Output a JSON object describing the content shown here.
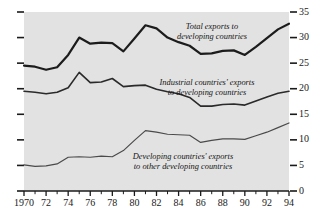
{
  "chart_data": {
    "type": "line",
    "title": "",
    "subtitle": "",
    "xlabel": "",
    "ylabel": "",
    "xlim": [
      1970,
      1994
    ],
    "ylim": [
      0,
      35
    ],
    "grid": false,
    "legend_position": "inline-annotations",
    "y_ticks": [
      "0",
      "5",
      "10",
      "15",
      "20",
      "25",
      "30",
      "35"
    ],
    "y_tick_values": [
      0,
      5,
      10,
      15,
      20,
      25,
      30,
      35
    ],
    "y_axis_side": "right",
    "x_ticks": [
      "1970",
      "72",
      "74",
      "76",
      "78",
      "80",
      "82",
      "84",
      "86",
      "88",
      "90",
      "92",
      "94"
    ],
    "x_tick_values": [
      1970,
      1972,
      1974,
      1976,
      1978,
      1980,
      1982,
      1984,
      1986,
      1988,
      1990,
      1992,
      1994
    ],
    "x_minor_tick_interval": 1,
    "x": [
      1970,
      1971,
      1972,
      1973,
      1974,
      1975,
      1976,
      1977,
      1978,
      1979,
      1980,
      1981,
      1982,
      1983,
      1984,
      1985,
      1986,
      1987,
      1988,
      1989,
      1990,
      1991,
      1992,
      1993,
      1994
    ],
    "series": [
      {
        "name": "Total exports to developing countries",
        "label_line1": "Total exports to",
        "label_line2": "developing countries",
        "color": "#1c1c1c",
        "width": 2.2,
        "values": [
          24.5,
          24.3,
          23.7,
          24.2,
          26.6,
          30.0,
          28.8,
          29.0,
          28.9,
          27.3,
          29.8,
          32.4,
          31.8,
          30.0,
          29.1,
          28.4,
          26.8,
          26.9,
          27.4,
          27.5,
          26.6,
          28.2,
          29.9,
          31.6,
          32.7
        ]
      },
      {
        "name": "Industrial countries' exports to developing countries",
        "label_line1": "Industrial countries' exports",
        "label_line2": "to developing countries",
        "color": "#2a2a2a",
        "width": 1.6,
        "values": [
          19.5,
          19.3,
          19.0,
          19.3,
          20.2,
          23.2,
          21.2,
          21.3,
          22.0,
          20.4,
          20.6,
          20.7,
          19.9,
          19.4,
          19.0,
          18.3,
          16.6,
          16.6,
          16.9,
          17.0,
          16.8,
          17.6,
          18.4,
          19.1,
          19.5
        ]
      },
      {
        "name": "Developing countries' exports to other developing countries",
        "label_line1": "Developing countries' exports",
        "label_line2": "to other developing countries",
        "color": "#4a4a4a",
        "width": 1.2,
        "values": [
          5.1,
          4.8,
          4.9,
          5.3,
          6.6,
          6.7,
          6.6,
          6.8,
          6.7,
          7.9,
          9.9,
          11.8,
          11.5,
          11.1,
          11.0,
          10.9,
          9.5,
          9.9,
          10.2,
          10.2,
          10.1,
          10.8,
          11.5,
          12.4,
          13.3
        ]
      }
    ]
  }
}
